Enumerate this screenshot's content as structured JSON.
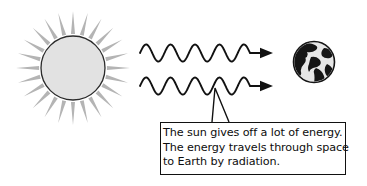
{
  "figure": {
    "background_color": "#ffffff",
    "ink_color": "#111111"
  },
  "sun": {
    "label": "sun",
    "disc": {
      "cx": 73,
      "cy": 68,
      "r": 32,
      "fill": "#e2e2e2",
      "stroke": "#2b2b2b"
    },
    "rays": {
      "count": 24,
      "inner_radius": 34,
      "outer_radius": 57,
      "color": "#b4b4b4",
      "half_width_deg": 3.4
    }
  },
  "earth": {
    "label": "earth",
    "cx": 314,
    "cy": 62,
    "r": 21,
    "ocean_fill": "#e6e6e6",
    "land_fill": "#151515",
    "stroke": "#151515"
  },
  "waves": [
    {
      "label": "radiation-wave-upper",
      "x_start": 140,
      "x_end": 250,
      "y_center": 53,
      "amplitude": 8.5,
      "cycles": 4.5,
      "arrow_tip_x": 273,
      "color": "#111111"
    },
    {
      "label": "radiation-wave-lower",
      "x_start": 140,
      "x_end": 250,
      "y_center": 86,
      "amplitude": 8.5,
      "cycles": 4.5,
      "arrow_tip_x": 273,
      "color": "#111111"
    }
  ],
  "callout": {
    "pointer": {
      "tip_x": 215,
      "tip_y": 88,
      "base_left_x": 212,
      "base_right_x": 229,
      "base_y": 122
    },
    "box": {
      "x": 160,
      "y": 122,
      "width": 186,
      "height": 53
    },
    "lines": [
      "The sun gives off a lot of energy.",
      "The energy travels through space",
      "to Earth by radiation."
    ]
  }
}
